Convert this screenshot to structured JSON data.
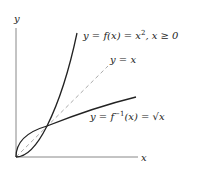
{
  "axes": {
    "x_label": "x",
    "y_label": "y"
  },
  "curves": {
    "f": {
      "label": "y = f(x) = x², x ≥ 0",
      "label_main": "y = f(x) = x",
      "label_exp": "2",
      "label_cond": ", x ≥ 0"
    },
    "identity": {
      "label": "y = x"
    },
    "inverse": {
      "label": "y = f⁻¹(x) = √x",
      "label_main": "y = f",
      "label_exp": "−1",
      "label_rest": "(x) = √x"
    }
  },
  "colors": {
    "curve": "#222222",
    "axis": "#888888",
    "dashed": "#aaaaaa"
  }
}
